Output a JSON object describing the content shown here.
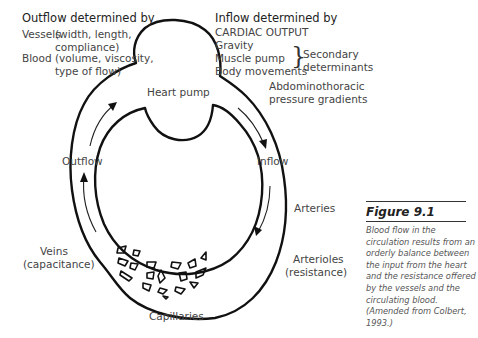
{
  "outflow": {
    "heading": "Outflow determined by",
    "vessels_label": "Vessels",
    "vessels_line1": "(width, length,",
    "vessels_line2": "compliance)",
    "blood_label": "Blood",
    "blood_line1": "(volume, viscosity,",
    "blood_line2": "type of flow)"
  },
  "inflow": {
    "heading": "Inflow determined by",
    "primary": "CARDIAC OUTPUT",
    "secondary_items": [
      "Gravity",
      "Muscle pump",
      "Body movements"
    ],
    "secondary_label_line1": "Secondary",
    "secondary_label_line2": "determinants",
    "other_line1": "Abdominothoracic",
    "other_line2": "pressure gradients"
  },
  "labels": {
    "heart_pump": "Heart pump",
    "outflow": "Outflow",
    "inflow": "Inflow",
    "arteries": "Arteries",
    "arterioles_line1": "Arterioles",
    "arterioles_line2": "(resistance)",
    "veins_line1": "Veins",
    "veins_line2": "(capacitance)",
    "capillaries": "Capillaries"
  },
  "figure": {
    "title": "Figure 9.1",
    "caption": "Blood flow in the circulation results from an orderly balance between the input from the heart and the resistance offered by the vessels and the circulating blood. (Amended from Colbert, 1993.)"
  },
  "colors": {
    "line": "#111111",
    "text": "#444444",
    "background": "#ffffff"
  }
}
